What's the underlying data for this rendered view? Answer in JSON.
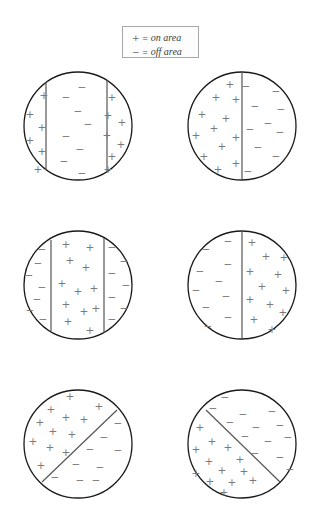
{
  "figure": {
    "background_color": "#ffffff",
    "width": 318,
    "height": 528,
    "circle_stroke_color": "#1a1a1a",
    "divider_stroke_color": "#555555",
    "symbol_color": "#7a7a7a"
  },
  "legend": {
    "name": "legend",
    "box": {
      "x": 122,
      "y": 26,
      "width": 77,
      "height": 32
    },
    "rows": [
      {
        "symbol": "+",
        "equals": "=",
        "text": "on area"
      },
      {
        "symbol": "−",
        "equals": "=",
        "text": "off area"
      }
    ]
  },
  "chart_data": {
    "type": "diagram",
    "legend": [
      {
        "symbol": "+",
        "meaning": "on area"
      },
      {
        "symbol": "-",
        "meaning": "off area"
      }
    ],
    "radius": 54,
    "panels": [
      {
        "id": "panel-1",
        "label": "top-left",
        "center": {
          "x": 78,
          "y": 126
        },
        "divider_type": "two-vertical",
        "dividers": [
          {
            "x1": 46,
            "y1": 82,
            "x2": 46,
            "y2": 170
          },
          {
            "x1": 107,
            "y1": 80,
            "x2": 107,
            "y2": 172
          }
        ],
        "regions": [
          {
            "name": "left",
            "sign": "+"
          },
          {
            "name": "middle",
            "sign": "-"
          },
          {
            "name": "right",
            "sign": "+"
          }
        ],
        "symbols": [
          {
            "s": "+",
            "x": 44,
            "y": 96
          },
          {
            "s": "+",
            "x": 30,
            "y": 115
          },
          {
            "s": "+",
            "x": 42,
            "y": 128
          },
          {
            "s": "+",
            "x": 30,
            "y": 141
          },
          {
            "s": "+",
            "x": 42,
            "y": 152
          },
          {
            "s": "+",
            "x": 38,
            "y": 170
          },
          {
            "s": "-",
            "x": 82,
            "y": 88
          },
          {
            "s": "-",
            "x": 66,
            "y": 98
          },
          {
            "s": "-",
            "x": 78,
            "y": 112
          },
          {
            "s": "-",
            "x": 88,
            "y": 125
          },
          {
            "s": "-",
            "x": 66,
            "y": 137
          },
          {
            "s": "-",
            "x": 80,
            "y": 150
          },
          {
            "s": "-",
            "x": 64,
            "y": 162
          },
          {
            "s": "-",
            "x": 82,
            "y": 174
          },
          {
            "s": "+",
            "x": 112,
            "y": 98
          },
          {
            "s": "+",
            "x": 108,
            "y": 116
          },
          {
            "s": "+",
            "x": 122,
            "y": 123
          },
          {
            "s": "+",
            "x": 107,
            "y": 136
          },
          {
            "s": "+",
            "x": 121,
            "y": 145
          },
          {
            "s": "+",
            "x": 112,
            "y": 157
          },
          {
            "s": "+",
            "x": 108,
            "y": 170
          }
        ]
      },
      {
        "id": "panel-2",
        "label": "top-right",
        "center": {
          "x": 242,
          "y": 126
        },
        "divider_type": "one-vertical",
        "dividers": [
          {
            "x1": 242,
            "y1": 72,
            "x2": 242,
            "y2": 180
          }
        ],
        "regions": [
          {
            "name": "left",
            "sign": "+"
          },
          {
            "name": "right",
            "sign": "-"
          }
        ],
        "symbols": [
          {
            "s": "+",
            "x": 230,
            "y": 85
          },
          {
            "s": "+",
            "x": 216,
            "y": 98
          },
          {
            "s": "+",
            "x": 236,
            "y": 100
          },
          {
            "s": "+",
            "x": 202,
            "y": 115
          },
          {
            "s": "+",
            "x": 226,
            "y": 119
          },
          {
            "s": "+",
            "x": 214,
            "y": 129
          },
          {
            "s": "+",
            "x": 196,
            "y": 136
          },
          {
            "s": "+",
            "x": 236,
            "y": 138
          },
          {
            "s": "+",
            "x": 222,
            "y": 147
          },
          {
            "s": "+",
            "x": 204,
            "y": 157
          },
          {
            "s": "+",
            "x": 236,
            "y": 164
          },
          {
            "s": "+",
            "x": 218,
            "y": 170
          },
          {
            "s": "-",
            "x": 246,
            "y": 87
          },
          {
            "s": "-",
            "x": 276,
            "y": 92
          },
          {
            "s": "-",
            "x": 255,
            "y": 107
          },
          {
            "s": "-",
            "x": 281,
            "y": 110
          },
          {
            "s": "-",
            "x": 268,
            "y": 124
          },
          {
            "s": "-",
            "x": 250,
            "y": 130
          },
          {
            "s": "-",
            "x": 280,
            "y": 133
          },
          {
            "s": "-",
            "x": 258,
            "y": 148
          },
          {
            "s": "-",
            "x": 276,
            "y": 157
          },
          {
            "s": "-",
            "x": 248,
            "y": 172
          }
        ]
      },
      {
        "id": "panel-3",
        "label": "middle-left",
        "center": {
          "x": 78,
          "y": 285
        },
        "divider_type": "two-vertical",
        "dividers": [
          {
            "x1": 51,
            "y1": 240,
            "x2": 51,
            "y2": 331
          },
          {
            "x1": 104,
            "y1": 238,
            "x2": 104,
            "y2": 333
          }
        ],
        "regions": [
          {
            "name": "left",
            "sign": "-"
          },
          {
            "name": "middle",
            "sign": "+"
          },
          {
            "name": "right",
            "sign": "-"
          }
        ],
        "symbols": [
          {
            "s": "-",
            "x": 42,
            "y": 250
          },
          {
            "s": "-",
            "x": 38,
            "y": 264
          },
          {
            "s": "-",
            "x": 29,
            "y": 276
          },
          {
            "s": "-",
            "x": 42,
            "y": 288
          },
          {
            "s": "-",
            "x": 37,
            "y": 300
          },
          {
            "s": "-",
            "x": 30,
            "y": 311
          },
          {
            "s": "-",
            "x": 43,
            "y": 320
          },
          {
            "s": "+",
            "x": 66,
            "y": 245
          },
          {
            "s": "+",
            "x": 90,
            "y": 248
          },
          {
            "s": "+",
            "x": 70,
            "y": 261
          },
          {
            "s": "+",
            "x": 86,
            "y": 268
          },
          {
            "s": "+",
            "x": 62,
            "y": 284
          },
          {
            "s": "+",
            "x": 78,
            "y": 292
          },
          {
            "s": "+",
            "x": 94,
            "y": 289
          },
          {
            "s": "+",
            "x": 66,
            "y": 305
          },
          {
            "s": "+",
            "x": 84,
            "y": 312
          },
          {
            "s": "+",
            "x": 96,
            "y": 309
          },
          {
            "s": "+",
            "x": 68,
            "y": 322
          },
          {
            "s": "+",
            "x": 90,
            "y": 331
          },
          {
            "s": "-",
            "x": 112,
            "y": 248
          },
          {
            "s": "-",
            "x": 124,
            "y": 262
          },
          {
            "s": "-",
            "x": 112,
            "y": 274
          },
          {
            "s": "-",
            "x": 126,
            "y": 286
          },
          {
            "s": "-",
            "x": 112,
            "y": 298
          },
          {
            "s": "-",
            "x": 124,
            "y": 309
          },
          {
            "s": "-",
            "x": 112,
            "y": 320
          }
        ]
      },
      {
        "id": "panel-4",
        "label": "middle-right",
        "center": {
          "x": 242,
          "y": 285
        },
        "divider_type": "one-vertical",
        "dividers": [
          {
            "x1": 242,
            "y1": 231,
            "x2": 242,
            "y2": 339
          }
        ],
        "regions": [
          {
            "name": "left",
            "sign": "-"
          },
          {
            "name": "right",
            "sign": "+"
          }
        ],
        "symbols": [
          {
            "s": "-",
            "x": 228,
            "y": 242
          },
          {
            "s": "-",
            "x": 206,
            "y": 250
          },
          {
            "s": "-",
            "x": 228,
            "y": 265
          },
          {
            "s": "-",
            "x": 200,
            "y": 272
          },
          {
            "s": "-",
            "x": 219,
            "y": 282
          },
          {
            "s": "-",
            "x": 196,
            "y": 291
          },
          {
            "s": "-",
            "x": 226,
            "y": 297
          },
          {
            "s": "-",
            "x": 206,
            "y": 308
          },
          {
            "s": "-",
            "x": 228,
            "y": 318
          },
          {
            "s": "-",
            "x": 208,
            "y": 327
          },
          {
            "s": "+",
            "x": 252,
            "y": 243
          },
          {
            "s": "+",
            "x": 266,
            "y": 257
          },
          {
            "s": "+",
            "x": 284,
            "y": 258
          },
          {
            "s": "+",
            "x": 250,
            "y": 272
          },
          {
            "s": "+",
            "x": 278,
            "y": 275
          },
          {
            "s": "+",
            "x": 262,
            "y": 287
          },
          {
            "s": "+",
            "x": 286,
            "y": 291
          },
          {
            "s": "+",
            "x": 250,
            "y": 300
          },
          {
            "s": "+",
            "x": 270,
            "y": 305
          },
          {
            "s": "+",
            "x": 283,
            "y": 313
          },
          {
            "s": "+",
            "x": 254,
            "y": 320
          },
          {
            "s": "+",
            "x": 272,
            "y": 330
          }
        ]
      },
      {
        "id": "panel-5",
        "label": "bottom-left",
        "center": {
          "x": 78,
          "y": 444
        },
        "divider_type": "diagonal-up",
        "dividers": [
          {
            "x1": 42,
            "y1": 482,
            "x2": 117,
            "y2": 410
          }
        ],
        "regions": [
          {
            "name": "upper-left",
            "sign": "+"
          },
          {
            "name": "lower-right",
            "sign": "-"
          }
        ],
        "symbols": [
          {
            "s": "+",
            "x": 70,
            "y": 397
          },
          {
            "s": "+",
            "x": 51,
            "y": 410
          },
          {
            "s": "+",
            "x": 99,
            "y": 407
          },
          {
            "s": "+",
            "x": 40,
            "y": 423
          },
          {
            "s": "+",
            "x": 66,
            "y": 418
          },
          {
            "s": "+",
            "x": 84,
            "y": 420
          },
          {
            "s": "+",
            "x": 53,
            "y": 432
          },
          {
            "s": "+",
            "x": 72,
            "y": 435
          },
          {
            "s": "+",
            "x": 33,
            "y": 442
          },
          {
            "s": "+",
            "x": 50,
            "y": 448
          },
          {
            "s": "+",
            "x": 66,
            "y": 453
          },
          {
            "s": "+",
            "x": 41,
            "y": 466
          },
          {
            "s": "-",
            "x": 118,
            "y": 424
          },
          {
            "s": "-",
            "x": 104,
            "y": 438
          },
          {
            "s": "-",
            "x": 90,
            "y": 450
          },
          {
            "s": "-",
            "x": 118,
            "y": 451
          },
          {
            "s": "-",
            "x": 76,
            "y": 465
          },
          {
            "s": "-",
            "x": 100,
            "y": 468
          },
          {
            "s": "-",
            "x": 55,
            "y": 478
          },
          {
            "s": "-",
            "x": 80,
            "y": 481
          },
          {
            "s": "-",
            "x": 96,
            "y": 481
          }
        ]
      },
      {
        "id": "panel-6",
        "label": "bottom-right",
        "center": {
          "x": 242,
          "y": 444
        },
        "divider_type": "diagonal-down",
        "dividers": [
          {
            "x1": 206,
            "y1": 410,
            "x2": 280,
            "y2": 482
          }
        ],
        "regions": [
          {
            "name": "upper-right",
            "sign": "-"
          },
          {
            "name": "lower-left",
            "sign": "+"
          }
        ],
        "symbols": [
          {
            "s": "-",
            "x": 225,
            "y": 398
          },
          {
            "s": "-",
            "x": 213,
            "y": 409
          },
          {
            "s": "-",
            "x": 243,
            "y": 415
          },
          {
            "s": "-",
            "x": 272,
            "y": 412
          },
          {
            "s": "-",
            "x": 230,
            "y": 423
          },
          {
            "s": "-",
            "x": 256,
            "y": 428
          },
          {
            "s": "-",
            "x": 280,
            "y": 426
          },
          {
            "s": "-",
            "x": 245,
            "y": 437
          },
          {
            "s": "-",
            "x": 268,
            "y": 442
          },
          {
            "s": "-",
            "x": 288,
            "y": 438
          },
          {
            "s": "-",
            "x": 255,
            "y": 454
          },
          {
            "s": "-",
            "x": 280,
            "y": 458
          },
          {
            "s": "-",
            "x": 290,
            "y": 470
          },
          {
            "s": "+",
            "x": 200,
            "y": 428
          },
          {
            "s": "+",
            "x": 212,
            "y": 442
          },
          {
            "s": "+",
            "x": 196,
            "y": 450
          },
          {
            "s": "+",
            "x": 228,
            "y": 448
          },
          {
            "s": "+",
            "x": 209,
            "y": 462
          },
          {
            "s": "+",
            "x": 240,
            "y": 460
          },
          {
            "s": "+",
            "x": 222,
            "y": 471
          },
          {
            "s": "+",
            "x": 196,
            "y": 474
          },
          {
            "s": "+",
            "x": 244,
            "y": 472
          },
          {
            "s": "+",
            "x": 210,
            "y": 482
          },
          {
            "s": "+",
            "x": 232,
            "y": 483
          },
          {
            "s": "+",
            "x": 253,
            "y": 481
          },
          {
            "s": "+",
            "x": 224,
            "y": 493
          }
        ]
      }
    ]
  }
}
